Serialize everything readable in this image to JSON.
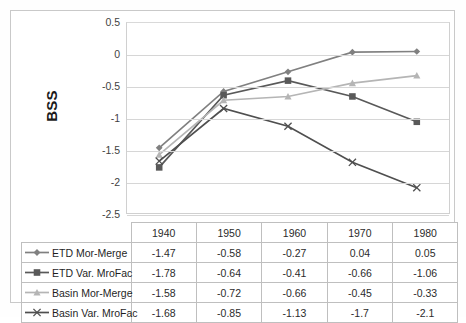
{
  "chart": {
    "type": "line",
    "ylabel": "BSS",
    "yticks": [
      "0.5",
      "0",
      "-0.5",
      "-1",
      "-1.5",
      "-2",
      "-2.5"
    ],
    "ylim": [
      -2.5,
      0.5
    ],
    "grid": true,
    "legend_position": "table-below"
  },
  "chart_data": {
    "type": "line",
    "title": "",
    "xlabel": "",
    "ylabel": "BSS",
    "ylim": [
      -2.5,
      0.5
    ],
    "grid": true,
    "categories": [
      "1940",
      "1950",
      "1960",
      "1970",
      "1980"
    ],
    "series": [
      {
        "name": "ETD Mor-Merge",
        "marker": "diamond",
        "color": "#808080",
        "values": [
          -1.47,
          -0.58,
          -0.27,
          0.04,
          0.05
        ],
        "labels": [
          "-1.47",
          "-0.58",
          "-0.27",
          "0.04",
          "0.05"
        ]
      },
      {
        "name": "ETD Var. MroFac",
        "marker": "square",
        "color": "#595959",
        "values": [
          -1.78,
          -0.64,
          -0.41,
          -0.66,
          -1.06
        ],
        "labels": [
          "-1.78",
          "-0.64",
          "-0.41",
          "-0.66",
          "-1.06"
        ]
      },
      {
        "name": "Basin Mor-Merge",
        "marker": "triangle",
        "color": "#b5b5b5",
        "values": [
          -1.58,
          -0.72,
          -0.66,
          -0.45,
          -0.33
        ],
        "labels": [
          "-1.58",
          "-0.72",
          "-0.66",
          "-0.45",
          "-0.33"
        ]
      },
      {
        "name": "Basin Var. MroFac",
        "marker": "cross",
        "color": "#4f4f4f",
        "values": [
          -1.68,
          -0.85,
          -1.13,
          -1.7,
          -2.1
        ],
        "labels": [
          "-1.68",
          "-0.85",
          "-1.13",
          "-1.7",
          "-2.1"
        ]
      }
    ],
    "ylabel_ticks": [
      "0.5",
      "0",
      "-0.5",
      "-1",
      "-1.5",
      "-2",
      "-2.5"
    ]
  },
  "table": {
    "header_blank": "",
    "columns": [
      "1940",
      "1950",
      "1960",
      "1970",
      "1980"
    ],
    "rows": [
      {
        "label": "ETD Mor-Merge",
        "marker": "diamond",
        "color": "#808080",
        "cells": [
          "-1.47",
          "-0.58",
          "-0.27",
          "0.04",
          "0.05"
        ]
      },
      {
        "label": "ETD Var. MroFac",
        "marker": "square",
        "color": "#595959",
        "cells": [
          "-1.78",
          "-0.64",
          "-0.41",
          "-0.66",
          "-1.06"
        ]
      },
      {
        "label": "Basin Mor-Merge",
        "marker": "triangle",
        "color": "#b5b5b5",
        "cells": [
          "-1.58",
          "-0.72",
          "-0.66",
          "-0.45",
          "-0.33"
        ]
      },
      {
        "label": "Basin Var. MroFac",
        "marker": "cross",
        "color": "#4f4f4f",
        "cells": [
          "-1.68",
          "-0.85",
          "-1.13",
          "-1.7",
          "-2.1"
        ]
      }
    ]
  }
}
